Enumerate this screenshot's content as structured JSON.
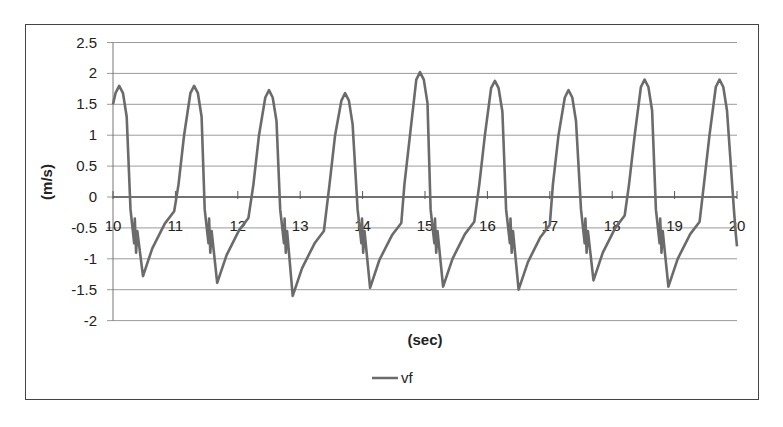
{
  "chart_data": {
    "type": "line",
    "title": "",
    "xlabel": "(sec)",
    "ylabel": "(m/s)",
    "xlim": [
      10,
      20
    ],
    "ylim": [
      -2,
      2.5
    ],
    "x_ticks": [
      "10",
      "11",
      "12",
      "13",
      "14",
      "15",
      "16",
      "17",
      "18",
      "19",
      "20"
    ],
    "y_ticks": [
      "2.5",
      "2",
      "1.5",
      "1",
      "0.5",
      "0",
      "-0.5",
      "-1",
      "-1.5",
      "-2"
    ],
    "grid": true,
    "legend": {
      "position": "bottom",
      "entries": [
        "vf"
      ]
    },
    "series": [
      {
        "name": "vf",
        "color": "#6b6b6b",
        "peaks": [
          {
            "t": 10.1,
            "v": 1.8
          },
          {
            "t": 11.3,
            "v": 1.8
          },
          {
            "t": 12.5,
            "v": 1.73
          },
          {
            "t": 13.72,
            "v": 1.68
          },
          {
            "t": 14.92,
            "v": 2.02
          },
          {
            "t": 16.12,
            "v": 1.88
          },
          {
            "t": 17.3,
            "v": 1.73
          },
          {
            "t": 18.52,
            "v": 1.9
          },
          {
            "t": 19.72,
            "v": 1.9
          }
        ],
        "troughs": [
          {
            "t": 10.48,
            "v": -1.28
          },
          {
            "t": 11.67,
            "v": -1.39
          },
          {
            "t": 12.88,
            "v": -1.6
          },
          {
            "t": 14.12,
            "v": -1.47
          },
          {
            "t": 15.29,
            "v": -1.45
          },
          {
            "t": 16.5,
            "v": -1.5
          },
          {
            "t": 17.7,
            "v": -1.35
          },
          {
            "t": 18.9,
            "v": -1.45
          }
        ],
        "end": {
          "t": 20.0,
          "v": -0.8
        }
      }
    ]
  }
}
